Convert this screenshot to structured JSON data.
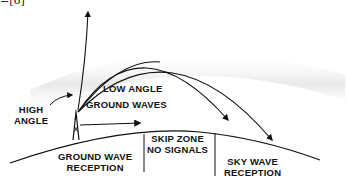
{
  "reference": "=[6]",
  "labels": {
    "high_angle": [
      "HIGH",
      "ANGLE"
    ],
    "low_angle": "LOW ANGLE",
    "ground_waves": "GROUND WAVES",
    "skip_zone": [
      "SKIP ZONE",
      "NO SIGNALS"
    ],
    "ground_wave_reception": [
      "GROUND WAVE",
      "RECEPTION"
    ],
    "sky_wave_reception": [
      "SKY WAVE",
      "RECEPTION"
    ]
  },
  "colors": {
    "ink": "#111111",
    "ionosphere": "#e8e8e8"
  }
}
